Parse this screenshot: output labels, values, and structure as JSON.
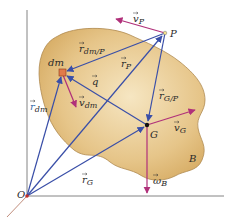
{
  "figure": {
    "body_label": "B",
    "origin_label": "O",
    "points": {
      "dm": {
        "label": "dm",
        "x": 63,
        "y": 73
      },
      "P": {
        "label": "P",
        "x": 165,
        "y": 33
      },
      "G": {
        "label": "G",
        "x": 147,
        "y": 125
      },
      "O": {
        "label": "O",
        "x": 27,
        "y": 196
      }
    },
    "vectors": {
      "r_dm": {
        "symbol": "r",
        "subscript": "dm",
        "color": "#3a4fa8"
      },
      "r_P": {
        "symbol": "r",
        "subscript": "P",
        "color": "#3a4fa8"
      },
      "r_G": {
        "symbol": "r",
        "subscript": "G",
        "color": "#3a4fa8"
      },
      "r_dm_P": {
        "symbol": "r",
        "subscript": "dm/P",
        "color": "#3a4fa8"
      },
      "r_G_P": {
        "symbol": "r",
        "subscript": "G/P",
        "color": "#3a4fa8"
      },
      "q": {
        "symbol": "q",
        "subscript": "",
        "color": "#3a4fa8"
      },
      "v_P": {
        "symbol": "v",
        "subscript": "P",
        "color": "#b0307a"
      },
      "v_dm": {
        "symbol": "v",
        "subscript": "dm",
        "color": "#b0307a"
      },
      "v_G": {
        "symbol": "v",
        "subscript": "G",
        "color": "#b0307a"
      },
      "omega_B": {
        "symbol": "ω",
        "subscript": "B",
        "color": "#b0307a"
      }
    },
    "colors": {
      "body_fill": "#e2bf7e",
      "body_edge": "#a8834a",
      "axis": "#555555",
      "position_vector": "#3a4fa8",
      "velocity_vector": "#b0307a",
      "dm_marker": "#e07a4a"
    }
  }
}
